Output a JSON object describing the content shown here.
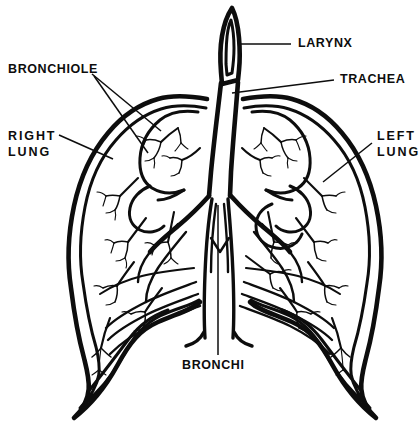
{
  "diagram": {
    "title": "Human Respiratory System — Lungs, Trachea and Bronchi",
    "background_color": "#ffffff",
    "ink_color": "#0d0d0d",
    "style": "black-and-white line drawing",
    "labels": [
      {
        "id": "larynx",
        "text": "LARYNX",
        "text_x": 298,
        "text_y": 44,
        "anchor": "start",
        "spacing": "tight",
        "leaders": [
          {
            "d": "M 291 44 L 241 44"
          }
        ]
      },
      {
        "id": "trachea",
        "text": "TRACHEA",
        "text_x": 340,
        "text_y": 80,
        "anchor": "start",
        "spacing": "tight",
        "leaders": [
          {
            "d": "M 334 80 L 232 93"
          }
        ]
      },
      {
        "id": "bronchiole",
        "text": "BRONCHIOLE",
        "text_x": 8,
        "text_y": 70,
        "anchor": "start",
        "spacing": "tight",
        "leaders": [
          {
            "d": "M 92 74 L 161 131"
          },
          {
            "d": "M 94 76 L 148 153"
          }
        ]
      },
      {
        "id": "right-lung",
        "text_lines": [
          "RIGHT",
          "LUNG"
        ],
        "text_x": 8,
        "text_y": 137,
        "line_height": 16,
        "anchor": "start",
        "spacing": "wide",
        "leaders": [
          {
            "d": "M 59 135 L 113 159"
          }
        ]
      },
      {
        "id": "left-lung",
        "text_lines": [
          "LEFT",
          "LUNG"
        ],
        "text_x": 377,
        "text_y": 137,
        "line_height": 16,
        "anchor": "start",
        "spacing": "wide",
        "leaders": [
          {
            "d": "M 372 143 L 323 182"
          }
        ]
      },
      {
        "id": "bronchi",
        "text": "BRONCHI",
        "text_x": 182,
        "text_y": 366,
        "anchor": "start",
        "spacing": "tight",
        "leaders": [
          {
            "d": "M 218 205 L 218 355"
          }
        ]
      }
    ],
    "parts": [
      {
        "id": "larynx",
        "name": "Larynx",
        "label": "LARYNX"
      },
      {
        "id": "trachea",
        "name": "Trachea",
        "label": "TRACHEA"
      },
      {
        "id": "bronchi",
        "name": "Bronchi",
        "label": "BRONCHI"
      },
      {
        "id": "bronchiole",
        "name": "Bronchiole",
        "label": "BRONCHIOLE"
      },
      {
        "id": "right-lung",
        "name": "Right lung",
        "label": "RIGHT LUNG"
      },
      {
        "id": "left-lung",
        "name": "Left lung",
        "label": "LEFT LUNG"
      }
    ]
  }
}
